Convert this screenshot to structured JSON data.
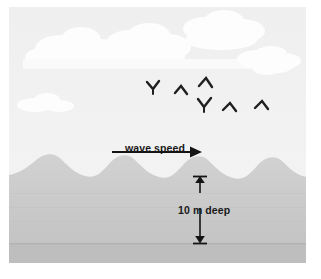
{
  "illustration": {
    "title": "Ocean wave diagram",
    "labels": {
      "wave_speed": "wave speed",
      "depth": "10 m deep"
    },
    "annotations": [
      {
        "name": "wave-speed-arrow",
        "kind": "single-headed-horizontal-arrow",
        "direction": "right",
        "label": "wave speed"
      },
      {
        "name": "depth-arrow",
        "kind": "double-headed-vertical-arrow",
        "label": "10 m deep",
        "value": 10,
        "unit": "m"
      }
    ],
    "elements": {
      "sky": "pale gray sky",
      "clouds": "white cumulus clouds",
      "birds": "flock of six birds",
      "water": "gray ocean with wave crests",
      "seabed": "darker gray seafloor band"
    },
    "bird_count": 6,
    "wave_crest_count": 5,
    "colors": {
      "sky": "#f1f1f1",
      "cloud": "#fdfdfd",
      "water": "#cfcfcf",
      "water_shade": "#c6c6c6",
      "seabed": "#bdbdbd",
      "ink": "#1a1a1a",
      "frame": "#ffffff"
    }
  }
}
